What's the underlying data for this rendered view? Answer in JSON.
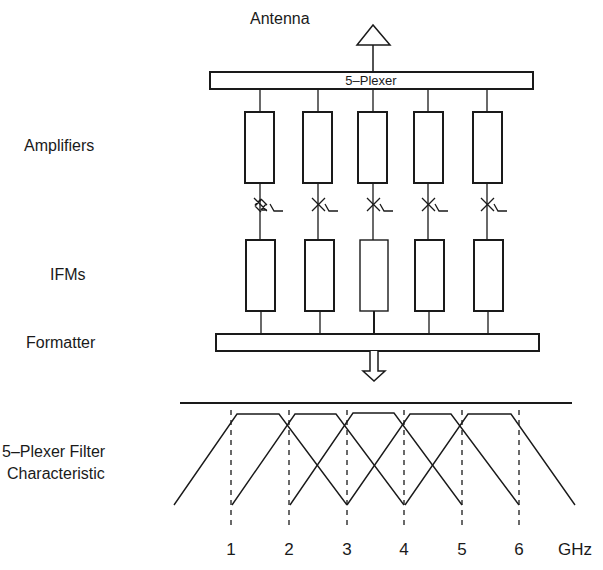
{
  "diagram": {
    "antenna_label": "Antenna",
    "plexer_label": "5–Plexer",
    "side_labels": {
      "amplifiers": "Amplifiers",
      "ifms": "IFMs",
      "formatter": "Formatter",
      "filter_line1": "5–Plexer Filter",
      "filter_line2": "Characteristic"
    },
    "channels": 5,
    "axis": {
      "ticks": [
        "1",
        "2",
        "3",
        "4",
        "5",
        "6"
      ],
      "unit": "GHz"
    }
  }
}
